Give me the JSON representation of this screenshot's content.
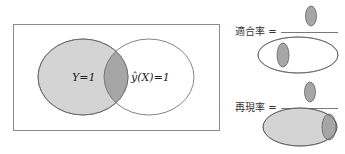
{
  "venn": {
    "label_left": "Y=1",
    "label_right": "ŷ(X)=1"
  },
  "formulas": [
    {
      "label": "適合率 =",
      "name": "precision"
    },
    {
      "label": "再現率 =",
      "name": "recall"
    }
  ],
  "colors": {
    "fill_light": "#d4d4d4",
    "fill_dark": "#a6a6a6",
    "stroke": "#555555",
    "frame": "#8a8a8a"
  }
}
